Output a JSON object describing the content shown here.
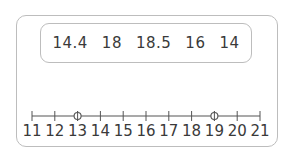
{
  "data_set": {
    "values": [
      "14.4",
      "18",
      "18.5",
      "16",
      "14"
    ]
  },
  "number_line": {
    "min": 11,
    "max": 21,
    "step": 1,
    "tick_labels": [
      "11",
      "12",
      "13",
      "14",
      "15",
      "16",
      "17",
      "18",
      "19",
      "20",
      "21"
    ],
    "marked_points": [
      13,
      19
    ],
    "marker_style": "open-circle",
    "line_color": "#555555"
  }
}
